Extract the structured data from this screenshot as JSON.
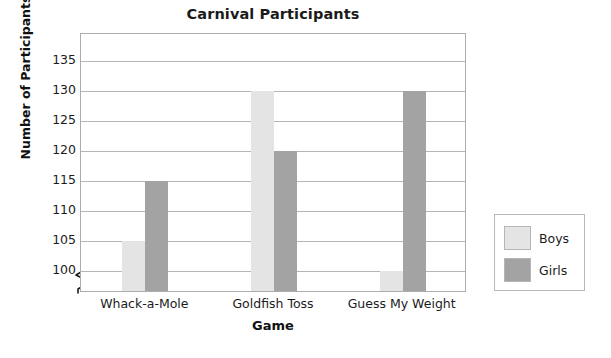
{
  "chart_data": {
    "type": "bar",
    "title": "Carnival Participants",
    "xlabel": "Game",
    "ylabel": "Number of Participants",
    "categories": [
      "Whack-a-Mole",
      "Goldfish Toss",
      "Guess My Weight"
    ],
    "series": [
      {
        "name": "Boys",
        "color": "#e4e4e4",
        "values": [
          105,
          130,
          100
        ]
      },
      {
        "name": "Girls",
        "color": "#a3a3a3",
        "values": [
          115,
          120,
          130
        ]
      }
    ],
    "ylim": [
      100,
      137
    ],
    "y_ticks": [
      100,
      105,
      110,
      115,
      120,
      125,
      130,
      135
    ],
    "y_tick_labels": [
      "100",
      "105",
      "110",
      "115",
      "120",
      "125",
      "130",
      "135"
    ],
    "grid": true,
    "axis_break": true,
    "axis_break_icon": "zigzag-axis-break-icon",
    "legend_position": "right-outside",
    "legend_entries": [
      "Boys",
      "Girls"
    ]
  }
}
